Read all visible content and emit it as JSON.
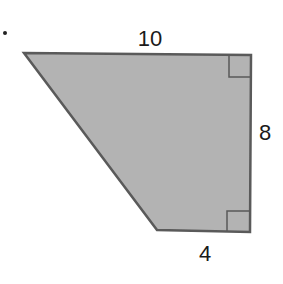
{
  "figure": {
    "shape": "trapezoid",
    "fill_color": "#b3b3b3",
    "stroke_color": "#5a5a5a",
    "vertices": [
      [
        24,
        53
      ],
      [
        251,
        55
      ],
      [
        250,
        232
      ],
      [
        157,
        230
      ]
    ],
    "labels": {
      "top": "10",
      "right": "8",
      "bottom": "4"
    },
    "right_angle_markers": [
      "top-right",
      "bottom-right"
    ]
  }
}
